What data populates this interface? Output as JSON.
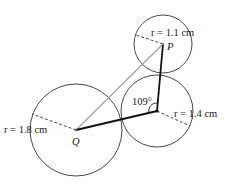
{
  "diagram": {
    "type": "geometry-circles",
    "circles": [
      {
        "id": "Q",
        "label": "Q",
        "radius_label": "r = 1.8 cm",
        "radius_value": 1.8,
        "unit": "cm"
      },
      {
        "id": "P",
        "label": "P",
        "radius_label": "r = 1.1 cm",
        "radius_value": 1.1,
        "unit": "cm"
      },
      {
        "id": "R",
        "label": "",
        "radius_label": "r = 1.4 cm",
        "radius_value": 1.4,
        "unit": "cm"
      }
    ],
    "angle": {
      "label": "109°",
      "value": 109,
      "unit": "degrees",
      "vertex": "center of 1.4 cm circle"
    },
    "segments": [
      {
        "from": "Q",
        "to": "P",
        "style": "gray"
      },
      {
        "from": "Q",
        "to": "R",
        "style": "bold"
      },
      {
        "from": "R",
        "to": "P",
        "style": "bold"
      }
    ]
  },
  "labels": {
    "point_q": "Q",
    "point_p": "P",
    "r_q": "r = 1.8 cm",
    "r_p": "r = 1.1 cm",
    "r_r": "r = 1.4 cm",
    "angle": "109°"
  }
}
